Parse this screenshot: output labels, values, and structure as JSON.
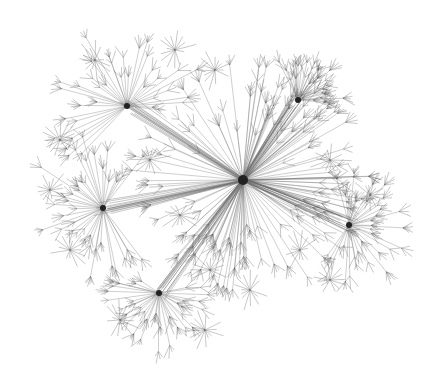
{
  "graph": {
    "type": "network",
    "layout": "radial hub-and-spoke",
    "edge_color": "#555555",
    "background": "#ffffff",
    "hubs": [
      {
        "id": "central-hub",
        "role": "root",
        "spokes": 64
      },
      {
        "id": "left-hub",
        "role": "major",
        "spokes": 40
      },
      {
        "id": "top-left-hub",
        "role": "major",
        "spokes": 36
      },
      {
        "id": "bottom-hub",
        "role": "major",
        "spokes": 36
      },
      {
        "id": "right-hub",
        "role": "major",
        "spokes": 34
      },
      {
        "id": "upper-right-hub",
        "role": "major",
        "spokes": 30
      }
    ],
    "links": [
      [
        "central-hub",
        "left-hub"
      ],
      [
        "central-hub",
        "top-left-hub"
      ],
      [
        "central-hub",
        "bottom-hub"
      ],
      [
        "central-hub",
        "right-hub"
      ],
      [
        "central-hub",
        "upper-right-hub"
      ]
    ]
  }
}
